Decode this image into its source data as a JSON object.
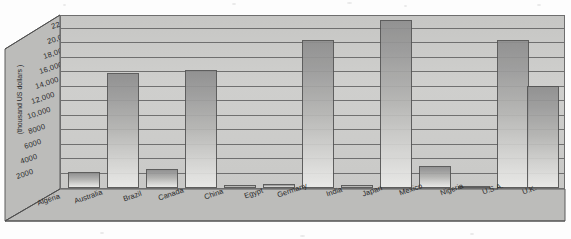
{
  "chart_data": {
    "type": "bar",
    "title": "",
    "subtitle": "",
    "xlabel": "",
    "ylabel": "(thousand US dollars )",
    "ylim": [
      0,
      24000
    ],
    "grid": true,
    "legend": "none",
    "orientation": "vertical-3d",
    "categories": [
      "Algeria",
      "Australia",
      "Brazil",
      "Canada",
      "China",
      "Egypt",
      "Germany",
      "India",
      "Japan",
      "Mexico",
      "Nigeria",
      "U.S.A.",
      "U.K."
    ],
    "values": [
      2200,
      16100,
      2700,
      16500,
      400,
      500,
      20600,
      400,
      23400,
      3100,
      300,
      20700,
      14200
    ],
    "ytick_labels": [
      "2000",
      "4000",
      "6000",
      "8000",
      "10,000",
      "12,000",
      "14,000",
      "16,000",
      "18,000",
      "20,000",
      "22,000"
    ],
    "ytick_values": [
      2000,
      4000,
      6000,
      8000,
      10000,
      12000,
      14000,
      16000,
      18000,
      20000,
      22000
    ],
    "colors": {
      "bar_top": "#8e8e8e",
      "bar_bottom": "#ebebe9",
      "panel": "#c9c9c7",
      "wall": "#b9b9b7",
      "floor": "#b9b9b7",
      "gridline": "#5f5f5f",
      "outline": "#5a5a5a",
      "text": "#2a2a2a",
      "page": "#fdfdfd"
    }
  }
}
